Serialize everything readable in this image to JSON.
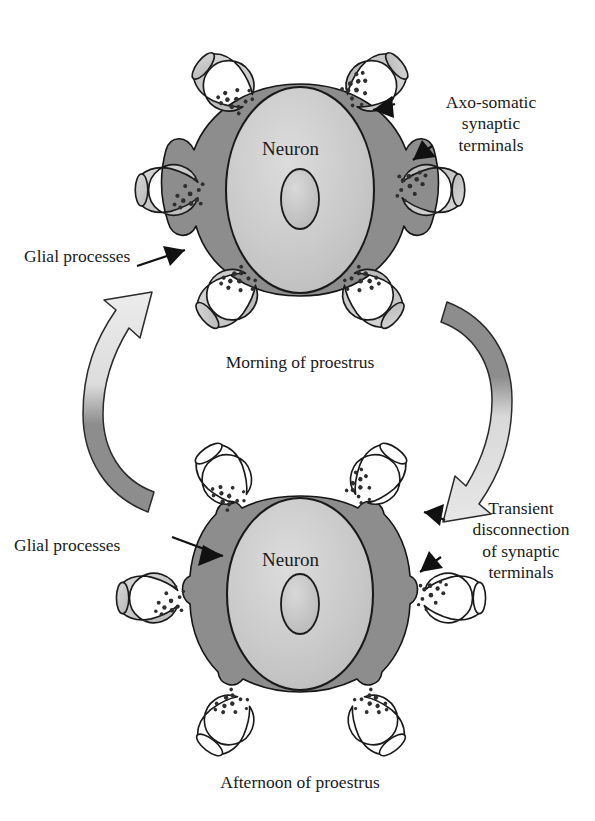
{
  "figure": {
    "type": "biological-diagram"
  },
  "panels": [
    {
      "id": "top",
      "caption": "Morning of proestrus",
      "neuron_label": "Neuron",
      "state": "connected",
      "terminal_count": 6,
      "terminal_fill": "#c4c4c4",
      "glia_coverage": "partial"
    },
    {
      "id": "bottom",
      "caption": "Afternoon of proestrus",
      "neuron_label": "Neuron",
      "state": "disconnected",
      "terminal_count": 6,
      "terminal_fill": "#ffffff",
      "glia_coverage": "complete"
    }
  ],
  "labels": {
    "axo_somatic": "Axo-somatic\nsynaptic\nterminals",
    "glial_top": "Glial processes",
    "glial_bottom": "Glial processes",
    "transient": "Transient\ndisconnection\nof synaptic\nterminals",
    "caption_top": "Morning of proestrus",
    "caption_bottom": "Afternoon of proestrus",
    "neuron_top": "Neuron",
    "neuron_bottom": "Neuron"
  },
  "cycle_arrows": [
    {
      "id": "right-arrow",
      "direction": "downward",
      "meaning": "morning to afternoon transition"
    },
    {
      "id": "left-arrow",
      "direction": "upward",
      "meaning": "afternoon back to morning"
    }
  ],
  "colors": {
    "glia_dark": "#8d8d8d",
    "soma_fill": "#c9c9c9",
    "nucleus_fill": "#c2c2c2",
    "terminal_fill": "#c4c4c4",
    "terminal_empty": "#ffffff",
    "vesicle": "#3a3a3a",
    "outline": "#1a1a1a",
    "arrow_light": "#e2e2e2",
    "arrow_dark": "#8d8d8d",
    "background": "#ffffff"
  }
}
